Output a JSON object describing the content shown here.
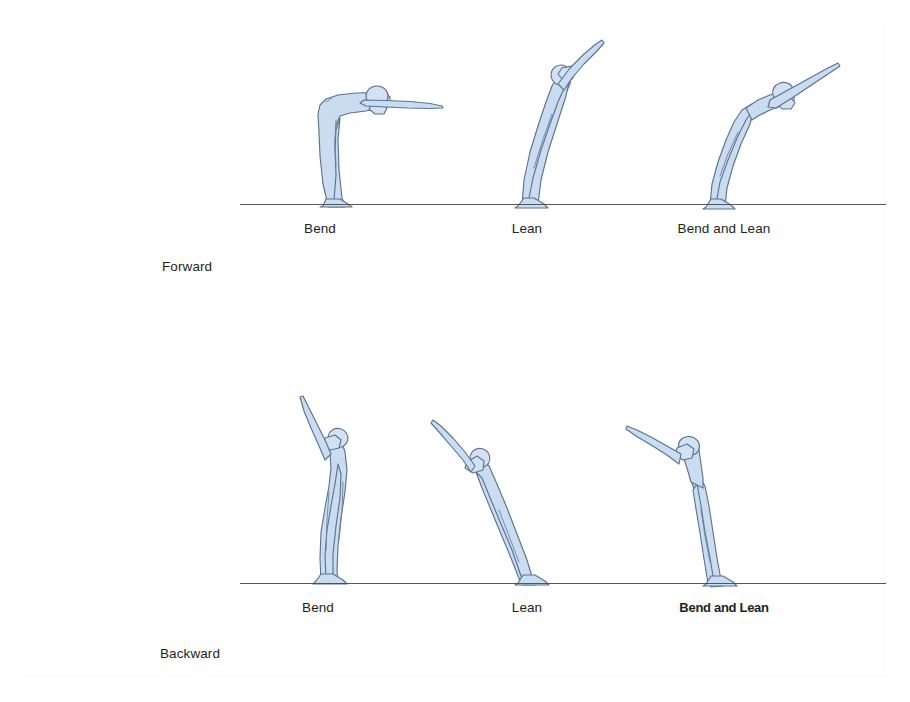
{
  "figure": {
    "background_color": "#ffffff",
    "body_fill_color": "#cadcf0",
    "body_outline_color": "#5d7390",
    "ground_line_color": "#4a4a46",
    "text_color": "#231f20"
  },
  "rows": [
    {
      "row_label": "Forward",
      "poses": [
        {
          "label": "Bend"
        },
        {
          "label": "Lean"
        },
        {
          "label": "Bend and Lean"
        }
      ]
    },
    {
      "row_label": "Backward",
      "poses": [
        {
          "label": "Bend"
        },
        {
          "label": "Lean"
        },
        {
          "label": "Bend and Lean"
        }
      ]
    }
  ]
}
